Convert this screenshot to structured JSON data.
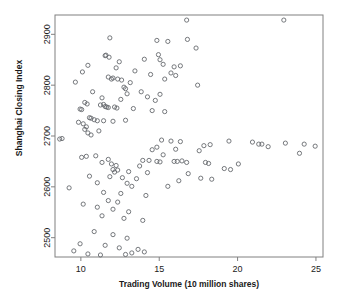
{
  "chart_data": {
    "type": "scatter",
    "title": "",
    "xlabel": "Trading Volume (10 million shares)",
    "ylabel": "Shanghai Closing Index",
    "xlim": [
      8.35,
      25.45
    ],
    "ylim": [
      2462,
      2938
    ],
    "xticks": [
      10,
      15,
      20,
      25
    ],
    "xticklabels": [
      "10",
      "15",
      "20",
      "25"
    ],
    "yticks": [
      2500,
      2600,
      2700,
      2800,
      2900
    ],
    "yticklabels": [
      "2500",
      "2600",
      "2700",
      "2800",
      "2900"
    ],
    "grid": false,
    "legend": null,
    "marker": "open-circle",
    "marker_color": "#666a6e",
    "marker_radius_px": 2.1,
    "n_points": 150,
    "points": [
      [
        16.75,
        2928
      ],
      [
        22.95,
        2928
      ],
      [
        11.85,
        2893
      ],
      [
        16.8,
        2890
      ],
      [
        14.85,
        2888
      ],
      [
        15.55,
        2886
      ],
      [
        17.35,
        2873
      ],
      [
        11.55,
        2858
      ],
      [
        11.6,
        2859
      ],
      [
        11.8,
        2855
      ],
      [
        14.95,
        2860
      ],
      [
        15.05,
        2850
      ],
      [
        14.05,
        2851
      ],
      [
        15.25,
        2841
      ],
      [
        12.45,
        2846
      ],
      [
        10.45,
        2839
      ],
      [
        16.35,
        2838
      ],
      [
        15.95,
        2836
      ],
      [
        10.1,
        2826
      ],
      [
        12.25,
        2834
      ],
      [
        13.45,
        2828
      ],
      [
        14.45,
        2821
      ],
      [
        15.75,
        2824
      ],
      [
        16.05,
        2819
      ],
      [
        11.75,
        2816
      ],
      [
        11.95,
        2812
      ],
      [
        12.05,
        2814
      ],
      [
        12.35,
        2812
      ],
      [
        12.6,
        2810
      ],
      [
        15.35,
        2812
      ],
      [
        9.65,
        2806
      ],
      [
        13.15,
        2805
      ],
      [
        17.45,
        2800
      ],
      [
        12.75,
        2796
      ],
      [
        12.85,
        2793
      ],
      [
        10.75,
        2787
      ],
      [
        12.95,
        2783
      ],
      [
        13.85,
        2787
      ],
      [
        15.05,
        2782
      ],
      [
        14.25,
        2777
      ],
      [
        11.35,
        2775
      ],
      [
        12.55,
        2772
      ],
      [
        14.75,
        2770
      ],
      [
        10.25,
        2766
      ],
      [
        10.4,
        2763
      ],
      [
        11.25,
        2761
      ],
      [
        11.45,
        2762
      ],
      [
        11.55,
        2758
      ],
      [
        11.65,
        2757
      ],
      [
        11.75,
        2756
      ],
      [
        12.15,
        2757
      ],
      [
        12.3,
        2755
      ],
      [
        9.95,
        2753
      ],
      [
        10.05,
        2752
      ],
      [
        13.35,
        2754
      ],
      [
        14.55,
        2750
      ],
      [
        15.35,
        2748
      ],
      [
        10.55,
        2736
      ],
      [
        10.65,
        2735
      ],
      [
        10.85,
        2732
      ],
      [
        11.05,
        2730
      ],
      [
        11.45,
        2730
      ],
      [
        12.05,
        2729
      ],
      [
        12.85,
        2731
      ],
      [
        9.85,
        2727
      ],
      [
        10.15,
        2724
      ],
      [
        10.35,
        2718
      ],
      [
        10.25,
        2713
      ],
      [
        11.15,
        2710
      ],
      [
        10.45,
        2706
      ],
      [
        10.65,
        2702
      ],
      [
        8.65,
        2694
      ],
      [
        8.8,
        2695
      ],
      [
        15.15,
        2692
      ],
      [
        15.75,
        2690
      ],
      [
        16.35,
        2689
      ],
      [
        19.45,
        2690
      ],
      [
        20.95,
        2688
      ],
      [
        23.05,
        2686
      ],
      [
        21.35,
        2684
      ],
      [
        21.55,
        2684
      ],
      [
        24.25,
        2684
      ],
      [
        18.25,
        2683
      ],
      [
        17.85,
        2681
      ],
      [
        21.95,
        2679
      ],
      [
        24.95,
        2680
      ],
      [
        14.85,
        2678
      ],
      [
        16.05,
        2674
      ],
      [
        14.55,
        2673
      ],
      [
        17.55,
        2671
      ],
      [
        23.95,
        2666
      ],
      [
        15.25,
        2663
      ],
      [
        10.05,
        2658
      ],
      [
        10.35,
        2660
      ],
      [
        10.95,
        2661
      ],
      [
        11.75,
        2654
      ],
      [
        13.95,
        2652
      ],
      [
        14.35,
        2652
      ],
      [
        14.85,
        2650
      ],
      [
        15.05,
        2649
      ],
      [
        15.95,
        2650
      ],
      [
        16.15,
        2650
      ],
      [
        16.45,
        2651
      ],
      [
        16.75,
        2648
      ],
      [
        17.95,
        2648
      ],
      [
        18.15,
        2646
      ],
      [
        20.05,
        2645
      ],
      [
        19.15,
        2636
      ],
      [
        19.55,
        2634
      ],
      [
        11.35,
        2648
      ],
      [
        11.95,
        2645
      ],
      [
        12.25,
        2642
      ],
      [
        13.75,
        2641
      ],
      [
        12.05,
        2634
      ],
      [
        12.35,
        2633
      ],
      [
        12.15,
        2629
      ],
      [
        13.05,
        2630
      ],
      [
        14.25,
        2628
      ],
      [
        16.85,
        2626
      ],
      [
        10.55,
        2621
      ],
      [
        11.85,
        2620
      ],
      [
        12.65,
        2618
      ],
      [
        13.55,
        2616
      ],
      [
        17.65,
        2617
      ],
      [
        18.35,
        2615
      ],
      [
        11.05,
        2608
      ],
      [
        12.95,
        2607
      ],
      [
        13.25,
        2601
      ],
      [
        9.25,
        2598
      ],
      [
        11.45,
        2589
      ],
      [
        12.55,
        2587
      ],
      [
        14.15,
        2583
      ],
      [
        11.75,
        2573
      ],
      [
        12.35,
        2570
      ],
      [
        10.15,
        2566
      ],
      [
        11.05,
        2560
      ],
      [
        12.05,
        2556
      ],
      [
        13.05,
        2551
      ],
      [
        11.35,
        2543
      ],
      [
        12.75,
        2538
      ],
      [
        13.95,
        2534
      ],
      [
        10.85,
        2512
      ],
      [
        12.05,
        2506
      ],
      [
        12.95,
        2499
      ],
      [
        9.95,
        2488
      ],
      [
        11.55,
        2485
      ],
      [
        12.45,
        2480
      ],
      [
        13.65,
        2477
      ],
      [
        14.05,
        2472
      ],
      [
        10.45,
        2468
      ],
      [
        11.25,
        2466
      ],
      [
        12.85,
        2467
      ],
      [
        13.25,
        2470
      ],
      [
        9.55,
        2474
      ],
      [
        16.25,
        2612
      ],
      [
        15.55,
        2601
      ]
    ]
  },
  "layout": {
    "plot_left_px": 55,
    "plot_right_px": 323,
    "plot_top_px": 15,
    "plot_bottom_px": 257,
    "tick_len_px": 4
  }
}
